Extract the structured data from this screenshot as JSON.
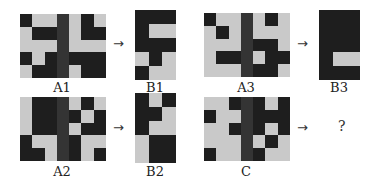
{
  "figure": {
    "panels": [
      {
        "id": "A1",
        "label": "A1",
        "x": 20,
        "y": 14,
        "cols": 7,
        "rows": 5,
        "cw": 12.3,
        "ch": 12.8,
        "cells": [
          [
            1,
            0,
            0,
            1,
            0,
            1,
            0
          ],
          [
            0,
            1,
            1,
            1,
            0,
            1,
            1
          ],
          [
            0,
            0,
            0,
            1,
            0,
            0,
            0
          ],
          [
            1,
            0,
            1,
            1,
            1,
            1,
            1
          ],
          [
            0,
            1,
            1,
            1,
            0,
            1,
            1
          ]
        ],
        "label_x": 32,
        "label_y": 81
      },
      {
        "id": "B1",
        "label": "B1",
        "x": 135,
        "y": 10,
        "cols": 3,
        "rows": 5,
        "cw": 13.5,
        "ch": 14,
        "cells": [
          [
            1,
            1,
            1
          ],
          [
            1,
            0,
            0
          ],
          [
            1,
            1,
            1
          ],
          [
            0,
            1,
            0
          ],
          [
            1,
            0,
            0
          ]
        ],
        "label_x": 125,
        "label_y": 81
      },
      {
        "id": "A3",
        "label": "A3",
        "x": 204,
        "y": 13,
        "cols": 7,
        "rows": 5,
        "cw": 12.3,
        "ch": 12.8,
        "cells": [
          [
            1,
            0,
            0,
            1,
            0,
            1,
            0
          ],
          [
            0,
            1,
            0,
            1,
            0,
            0,
            0
          ],
          [
            0,
            0,
            0,
            1,
            1,
            1,
            0
          ],
          [
            0,
            1,
            1,
            1,
            0,
            1,
            1
          ],
          [
            0,
            0,
            0,
            1,
            1,
            1,
            0
          ]
        ],
        "label_x": 216,
        "label_y": 81
      },
      {
        "id": "B3",
        "label": "B3",
        "x": 319,
        "y": 10,
        "cols": 3,
        "rows": 5,
        "cw": 13.5,
        "ch": 14,
        "cells": [
          [
            1,
            1,
            1
          ],
          [
            1,
            1,
            1
          ],
          [
            1,
            1,
            1
          ],
          [
            1,
            0,
            0
          ],
          [
            1,
            1,
            1
          ]
        ],
        "label_x": 309,
        "label_y": 81
      },
      {
        "id": "A2",
        "label": "A2",
        "x": 20,
        "y": 97,
        "cols": 7,
        "rows": 5,
        "cw": 12.3,
        "ch": 12.8,
        "cells": [
          [
            0,
            1,
            1,
            1,
            0,
            1,
            0
          ],
          [
            0,
            1,
            1,
            1,
            1,
            0,
            1
          ],
          [
            0,
            1,
            1,
            1,
            0,
            1,
            1
          ],
          [
            1,
            0,
            0,
            1,
            1,
            0,
            0
          ],
          [
            1,
            1,
            0,
            1,
            1,
            0,
            1
          ]
        ],
        "label_x": 32,
        "label_y": 165
      },
      {
        "id": "B2",
        "label": "B2",
        "x": 135,
        "y": 93,
        "cols": 3,
        "rows": 5,
        "cw": 13.5,
        "ch": 14,
        "cells": [
          [
            1,
            0,
            1
          ],
          [
            1,
            1,
            0
          ],
          [
            1,
            0,
            0
          ],
          [
            0,
            1,
            1
          ],
          [
            0,
            1,
            1
          ]
        ],
        "label_x": 125,
        "label_y": 165
      },
      {
        "id": "C",
        "label": "C",
        "x": 204,
        "y": 97,
        "cols": 7,
        "rows": 5,
        "cw": 12.3,
        "ch": 12.8,
        "cells": [
          [
            0,
            0,
            1,
            1,
            1,
            0,
            1
          ],
          [
            1,
            0,
            0,
            1,
            1,
            1,
            1
          ],
          [
            0,
            0,
            1,
            1,
            1,
            0,
            1
          ],
          [
            0,
            0,
            0,
            1,
            0,
            1,
            0
          ],
          [
            1,
            0,
            0,
            1,
            1,
            0,
            0
          ]
        ],
        "label_x": 216,
        "label_y": 165
      }
    ],
    "arrows": [
      {
        "glyph": "→",
        "x": 113,
        "y": 39
      },
      {
        "glyph": "→",
        "x": 297,
        "y": 39
      },
      {
        "glyph": "→",
        "x": 113,
        "y": 123
      },
      {
        "glyph": "→",
        "x": 297,
        "y": 123
      }
    ],
    "question": {
      "text": "?",
      "x": 338,
      "y": 118
    },
    "middle_column_index": 3,
    "colors": {
      "dark": "#1e1e1e",
      "light": "#c9c9c9",
      "middle": "#3a3a3a"
    }
  }
}
